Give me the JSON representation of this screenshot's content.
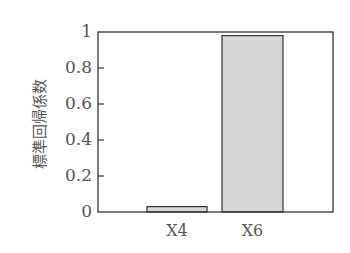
{
  "chart_data": {
    "type": "bar",
    "title": "",
    "xlabel": "",
    "ylabel": "標準回帰係数",
    "categories": [
      "X4",
      "X6"
    ],
    "values": [
      0.03,
      0.98
    ],
    "ylim": [
      0,
      1
    ],
    "yticks": [
      0,
      0.2,
      0.4,
      0.6,
      0.8,
      1
    ],
    "ytick_labels": [
      "0",
      "0.2",
      "0.4",
      "0.6",
      "0.8",
      "1"
    ],
    "grid": false,
    "legend": null,
    "bar_fill": "#d6d6d6",
    "bar_stroke": "#333333",
    "frame_color": "#333333"
  }
}
